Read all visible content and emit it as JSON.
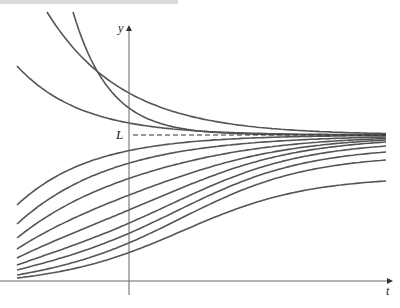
{
  "figure": {
    "y_axis_label": "y",
    "x_axis_label": "t",
    "equilibrium_label": "L",
    "line_color": "#555555",
    "axis_color": "#666666"
  },
  "geometry": {
    "y_axis_x": 129,
    "x_axis_y": 281,
    "y_axis_top": 28,
    "y_axis_bottom": 295,
    "x_axis_right": 390,
    "equilibrium_y": 135,
    "dash_start_x": 133,
    "curve_x_start": 17,
    "curve_x_end": 386
  },
  "curves_above": [
    {
      "start_x": 47,
      "start_y": 12,
      "axis_y": 93
    },
    {
      "start_x": 73,
      "start_y": 12,
      "axis_y": 108
    },
    {
      "start_x": 17,
      "start_y": 66,
      "axis_y": 123
    }
  ],
  "curves_below": [
    {
      "start_y": 178,
      "end_y": 133.5
    },
    {
      "start_y": 205,
      "end_y": 135.5
    },
    {
      "start_y": 224,
      "end_y": 137
    },
    {
      "start_y": 238,
      "end_y": 138.5
    },
    {
      "start_y": 249,
      "end_y": 140
    },
    {
      "start_y": 258,
      "end_y": 142
    },
    {
      "start_y": 265,
      "end_y": 146
    },
    {
      "start_y": 270,
      "end_y": 152
    },
    {
      "start_y": 275,
      "end_y": 160
    },
    {
      "start_y": 278,
      "end_y": 181
    }
  ]
}
